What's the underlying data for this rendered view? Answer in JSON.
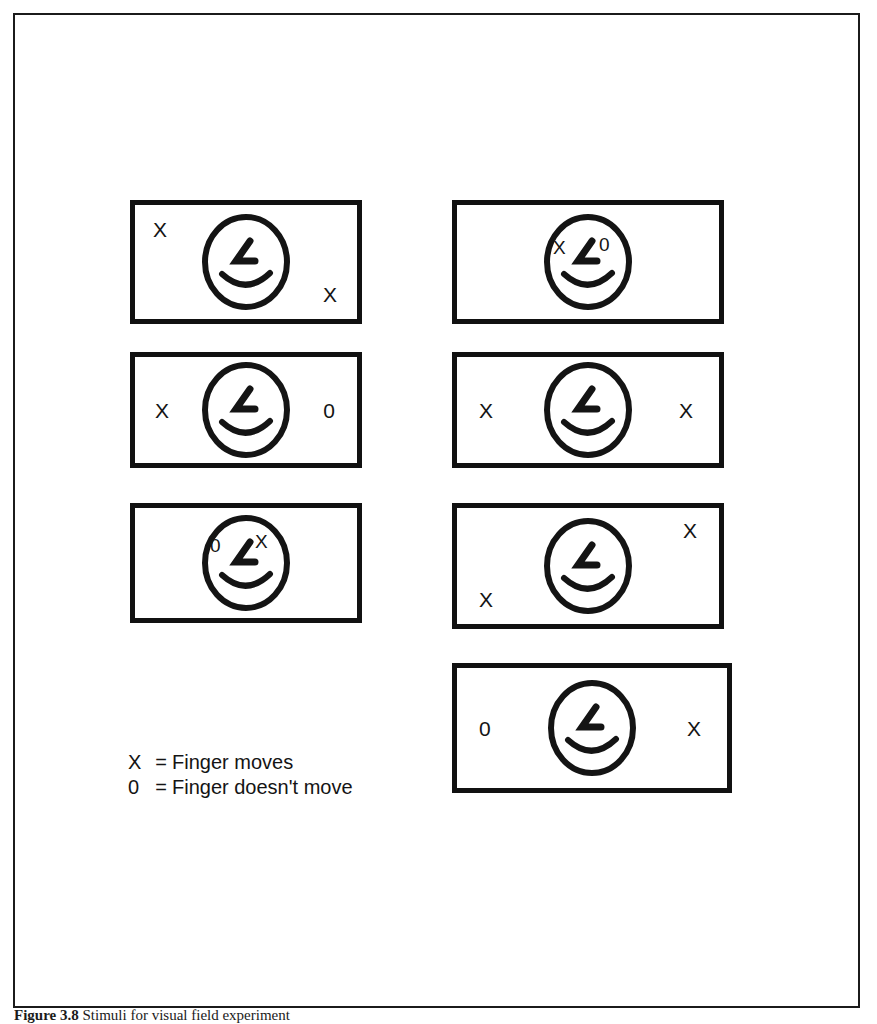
{
  "figure": {
    "caption_label": "Figure 3.8",
    "caption_text": "Stimuli for visual field experiment",
    "legend": [
      {
        "symbol": "X",
        "equals": "=",
        "meaning": "Finger moves"
      },
      {
        "symbol": "0",
        "equals": "=",
        "meaning": "Finger doesn't move"
      }
    ],
    "symbols": {
      "move": "X",
      "no_move": "0"
    },
    "colors": {
      "ink": "#141414",
      "frame": "#1b1b1b",
      "background": "#ffffff"
    },
    "panels": [
      {
        "id": "panel-1",
        "row": 1,
        "column": "left",
        "face": "smiley-face",
        "markers": [
          {
            "value": "X",
            "position": "top-left"
          },
          {
            "value": "X",
            "position": "bottom-right"
          }
        ]
      },
      {
        "id": "panel-2",
        "row": 1,
        "column": "right",
        "face": "smiley-face",
        "markers": [
          {
            "value": "X",
            "position": "face-left-eye"
          },
          {
            "value": "0",
            "position": "face-right-eye"
          }
        ]
      },
      {
        "id": "panel-3",
        "row": 2,
        "column": "left",
        "face": "smiley-face",
        "markers": [
          {
            "value": "X",
            "position": "middle-left"
          },
          {
            "value": "0",
            "position": "middle-right"
          }
        ]
      },
      {
        "id": "panel-4",
        "row": 2,
        "column": "right",
        "face": "smiley-face",
        "markers": [
          {
            "value": "X",
            "position": "middle-left"
          },
          {
            "value": "X",
            "position": "middle-right"
          }
        ]
      },
      {
        "id": "panel-5",
        "row": 3,
        "column": "left",
        "face": "smiley-face",
        "markers": [
          {
            "value": "0",
            "position": "face-left-eye"
          },
          {
            "value": "X",
            "position": "face-right-eye"
          }
        ]
      },
      {
        "id": "panel-6",
        "row": 3,
        "column": "right",
        "face": "smiley-face",
        "markers": [
          {
            "value": "X",
            "position": "top-right"
          },
          {
            "value": "X",
            "position": "bottom-left"
          }
        ]
      },
      {
        "id": "panel-7",
        "row": 4,
        "column": "right",
        "face": "smiley-face",
        "markers": [
          {
            "value": "0",
            "position": "middle-left"
          },
          {
            "value": "X",
            "position": "middle-right"
          }
        ]
      }
    ]
  }
}
